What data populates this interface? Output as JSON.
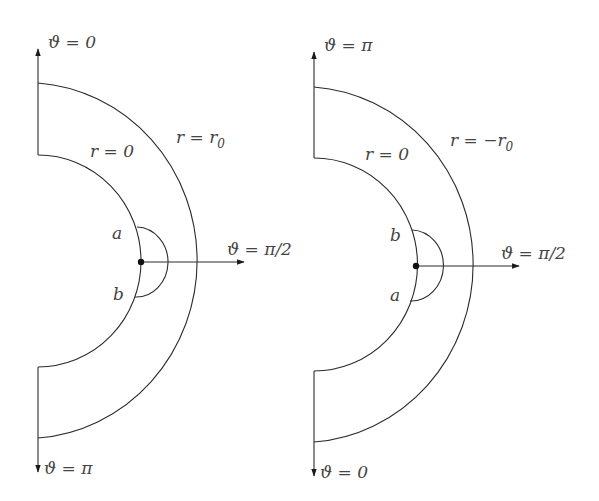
{
  "diagrams": [
    {
      "name": "left",
      "axis_top_label": "ϑ = 0",
      "axis_bottom_label": "ϑ = π",
      "axis_right_label": "ϑ = π/2",
      "outer_arc_label": "r = r",
      "outer_arc_label_sub": "0",
      "inner_arc_label": "r = 0",
      "point_top_label": "a",
      "point_bottom_label": "b"
    },
    {
      "name": "right",
      "axis_top_label": "ϑ = π",
      "axis_bottom_label": "ϑ = 0",
      "axis_right_label": "ϑ = π/2",
      "outer_arc_label": "r = −r",
      "outer_arc_label_sub": "0",
      "inner_arc_label": "r = 0",
      "point_top_label": "b",
      "point_bottom_label": "a"
    }
  ],
  "colors": {
    "line": "#2b2b2b",
    "text": "#444444",
    "background": "#ffffff"
  }
}
